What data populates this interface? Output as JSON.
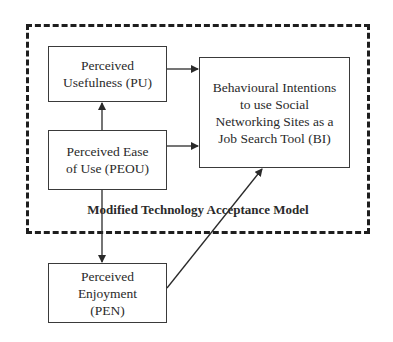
{
  "diagram": {
    "frame_label": "Modified Technology Acceptance Model",
    "nodes": {
      "pu": {
        "label": "Perceived\nUsefulness (PU)"
      },
      "peou": {
        "label": "Perceived Ease\nof Use (PEOU)"
      },
      "bi": {
        "label": "Behavioural Intentions\nto use Social\nNetworking Sites as a\nJob Search Tool (BI)"
      },
      "pen": {
        "label": "Perceived\nEnjoyment\n(PEN)"
      }
    },
    "edges": [
      {
        "from": "peou",
        "to": "pu"
      },
      {
        "from": "pu",
        "to": "bi"
      },
      {
        "from": "peou",
        "to": "bi"
      },
      {
        "from": "peou",
        "to": "pen"
      },
      {
        "from": "pen",
        "to": "bi"
      }
    ],
    "colors": {
      "line": "#2a2a2a",
      "frame": "#1e1e1e",
      "background": "#ffffff"
    }
  }
}
